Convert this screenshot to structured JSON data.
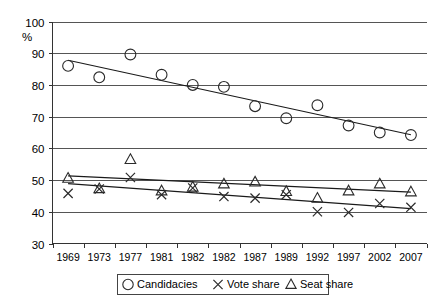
{
  "chart_data": {
    "type": "scatter",
    "title": "",
    "subtitle": "",
    "xlabel": "",
    "ylabel": "%",
    "ylim": [
      30,
      100
    ],
    "ytick_values": [
      30,
      40,
      50,
      60,
      70,
      80,
      90,
      100
    ],
    "ytick_labels": [
      "30",
      "40",
      "50",
      "60",
      "70",
      "80",
      "90",
      "100"
    ],
    "grid": true,
    "grid_axis": "y",
    "legend_position": "bottom-center",
    "categories": [
      "1969",
      "1973",
      "1977",
      "1981",
      "1982",
      "1982",
      "1987",
      "1989",
      "1992",
      "1997",
      "2002",
      "2007"
    ],
    "x_labels": [
      "1969",
      "1973",
      "1977",
      "1981",
      "1982",
      "1982",
      "1987",
      "1989",
      "1992",
      "1997",
      "2002",
      "2007"
    ],
    "series": [
      {
        "name": "Candidacies",
        "marker": "circle",
        "values": [
          86.0,
          82.4,
          89.6,
          83.2,
          80.0,
          79.4,
          73.3,
          69.5,
          73.6,
          67.2,
          65.0,
          64.2
        ],
        "trend_start": 87.8,
        "trend_end": 64.3
      },
      {
        "name": "Vote share",
        "marker": "cross",
        "values": [
          45.8,
          47.2,
          50.8,
          45.4,
          47.5,
          44.8,
          44.3,
          45.4,
          40.0,
          39.8,
          42.6,
          41.4
        ],
        "trend_start": 48.9,
        "trend_end": 41.0
      },
      {
        "name": "Seat share",
        "marker": "triangle",
        "values": [
          50.6,
          47.3,
          56.5,
          46.6,
          47.8,
          48.8,
          49.4,
          46.4,
          44.3,
          46.6,
          48.8,
          46.3
        ],
        "trend_start": 51.3,
        "trend_end": 46.2
      }
    ],
    "legend_entries": [
      {
        "label": "Candidacies",
        "marker": "circle"
      },
      {
        "label": "Vote share",
        "marker": "cross"
      },
      {
        "label": "Seat share",
        "marker": "triangle"
      }
    ],
    "colors": {
      "marker": "#2a2a2a",
      "trendline": "#1a1a1a",
      "gridline": "#555555",
      "axis": "#333333",
      "background": "#ffffff"
    }
  }
}
